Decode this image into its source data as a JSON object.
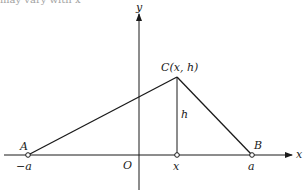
{
  "diagram": {
    "type": "geometry-coordinate-figure",
    "top_fragment": "may vary with x",
    "axes": {
      "x_label": "x",
      "y_label": "y",
      "origin_label": "O"
    },
    "points": {
      "A": {
        "label": "A",
        "tick_label": "−a"
      },
      "B": {
        "label": "B",
        "tick_label": "a"
      },
      "C": {
        "label": "C(x, h)"
      },
      "foot": {
        "tick_label": "x"
      }
    },
    "segments": [
      {
        "from": "A",
        "to": "C"
      },
      {
        "from": "C",
        "to": "B"
      },
      {
        "from": "C",
        "to": "foot",
        "label": "h"
      }
    ],
    "height_label": "h"
  }
}
